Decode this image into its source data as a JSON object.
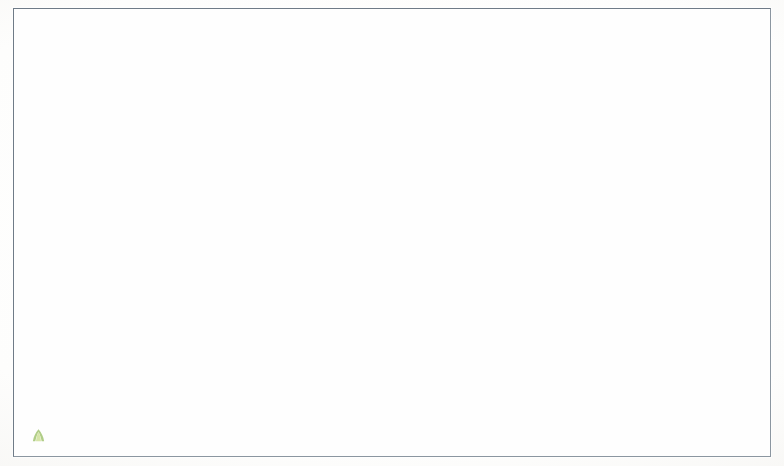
{
  "app": {
    "tool_name": "VOSviewer",
    "visualization_type": "bibliometric co-citation network map"
  },
  "chart_data": {
    "type": "scatter",
    "title": "",
    "xlabel": "",
    "ylabel": "",
    "grid": false,
    "legend": "none",
    "cluster_colors": {
      "cluster_1_social_science": "#e0633f",
      "cluster_2_economics": "#e8a4c8"
    },
    "note": "Node size encodes citation weight; node color encodes cluster; labels are abbreviated journal titles.",
    "nodes": [
      {
        "label": "Appl Energ",
        "x": 412,
        "y": 19,
        "size": 7,
        "cluster": 1
      },
      {
        "label": "Am J Agr Econ",
        "x": 488,
        "y": 14,
        "size": 3,
        "cluster": 1
      },
      {
        "label": "China Agrican Rev",
        "x": 513,
        "y": 46,
        "size": 2,
        "cluster": 1
      },
      {
        "label": "Annu Rev Anthropol",
        "x": 249,
        "y": 62,
        "size": 6,
        "cluster": 1
      },
      {
        "label": "Schumpeter Publ",
        "x": 580,
        "y": 58,
        "size": 3,
        "cluster": 1
      },
      {
        "label": "J Econometrics",
        "x": 711,
        "y": 68,
        "size": 3,
        "cluster": 2
      },
      {
        "label": "Contemp Pacific",
        "x": 299,
        "y": 84,
        "size": 6,
        "cluster": 1
      },
      {
        "label": "J Cold War Stud",
        "x": 371,
        "y": 81,
        "size": 8,
        "cluster": 1
      },
      {
        "label": "Hist Soc Emerg",
        "x": 452,
        "y": 82,
        "size": 3,
        "cluster": 1
      },
      {
        "label": "Renew Energy Econ",
        "x": 546,
        "y": 72,
        "size": 3,
        "cluster": 1
      },
      {
        "label": "Hum Ecol",
        "x": 400,
        "y": 100,
        "size": 9,
        "cluster": 1
      },
      {
        "label": "Oxford Rev Econ Pol",
        "x": 538,
        "y": 98,
        "size": 3,
        "cluster": 1
      },
      {
        "label": "J Rural Stud",
        "x": 412,
        "y": 125,
        "size": 9,
        "cluster": 1
      },
      {
        "label": "Am Anthropol",
        "x": 305,
        "y": 128,
        "size": 7,
        "cluster": 1
      },
      {
        "label": "Soc Res Behav Sc",
        "x": 561,
        "y": 136,
        "size": 3,
        "cluster": 1
      },
      {
        "label": "Ethnohistory",
        "x": 337,
        "y": 150,
        "size": 8,
        "cluster": 1
      },
      {
        "label": "Asian Econ Pap",
        "x": 668,
        "y": 143,
        "size": 3,
        "cluster": 2
      },
      {
        "label": "J Mod Afr Stud",
        "x": 83,
        "y": 168,
        "size": 6,
        "cluster": 1
      },
      {
        "label": "Defence Econ Soc Ger",
        "x": 435,
        "y": 158,
        "size": 5,
        "cluster": 1
      },
      {
        "label": "Geoforum",
        "x": 426,
        "y": 170,
        "size": 9,
        "cluster": 1
      },
      {
        "label": "World Bank Res Obser",
        "x": 585,
        "y": 172,
        "size": 4,
        "cluster": 2
      },
      {
        "label": "B Indones Econ Stud",
        "x": 714,
        "y": 170,
        "size": 3,
        "cluster": 2
      },
      {
        "label": "J Mat Cult",
        "x": 329,
        "y": 179,
        "size": 8,
        "cluster": 1
      },
      {
        "label": "T I Brit Geogr",
        "x": 425,
        "y": 185,
        "size": 8,
        "cluster": 1
      },
      {
        "label": "Soc Psic Soci",
        "x": 475,
        "y": 183,
        "size": 4,
        "cluster": 1
      },
      {
        "label": "J Environ Econ Manag",
        "x": 627,
        "y": 191,
        "size": 4,
        "cluster": 2
      },
      {
        "label": "Polit Geogr",
        "x": 429,
        "y": 199,
        "size": 9,
        "cluster": 1
      },
      {
        "label": "Econ Geogr",
        "x": 481,
        "y": 200,
        "size": 5,
        "cluster": 1
      },
      {
        "label": "Oxford B Econ Stat",
        "x": 668,
        "y": 209,
        "size": 4,
        "cluster": 2
      },
      {
        "label": "Oceania",
        "x": 285,
        "y": 211,
        "size": 6,
        "cluster": 1
      },
      {
        "label": "Am Ethnol",
        "x": 348,
        "y": 207,
        "size": 8,
        "cluster": 1
      },
      {
        "label": "Contemp Econ Policy",
        "x": 627,
        "y": 221,
        "size": 4,
        "cluster": 2
      },
      {
        "label": "J Econometrica",
        "x": 710,
        "y": 221,
        "size": 5,
        "cluster": 2
      },
      {
        "label": "Sensi Cult",
        "x": 356,
        "y": 226,
        "size": 7,
        "cluster": 1
      },
      {
        "label": "Econ Model",
        "x": 689,
        "y": 238,
        "size": 6,
        "cluster": 2
      },
      {
        "label": "Africa",
        "x": 397,
        "y": 239,
        "size": 9,
        "cluster": 1
      },
      {
        "label": "J Am Hist",
        "x": 460,
        "y": 241,
        "size": 8,
        "cluster": 1
      },
      {
        "label": "World Dev",
        "x": 555,
        "y": 239,
        "size": 7,
        "cluster": 1
      },
      {
        "label": "Empir Econ",
        "x": 632,
        "y": 248,
        "size": 4,
        "cluster": 2
      },
      {
        "label": "Appl Econ",
        "x": 699,
        "y": 254,
        "size": 6,
        "cluster": 2
      },
      {
        "label": "Med Anthropol Q",
        "x": 199,
        "y": 251,
        "size": 7,
        "cluster": 1
      },
      {
        "label": "East Afr Stud",
        "x": 430,
        "y": 256,
        "size": 10,
        "cluster": 1
      },
      {
        "label": "Transylv Rev Adm Sc",
        "x": 589,
        "y": 253,
        "size": 5,
        "cluster": 1
      },
      {
        "label": "Popul Dev Rev",
        "x": 330,
        "y": 255,
        "size": 6,
        "cluster": 1
      },
      {
        "label": "Hist Psychiatry",
        "x": 175,
        "y": 271,
        "size": 6,
        "cluster": 1
      },
      {
        "label": "J Dev Econ",
        "x": 679,
        "y": 272,
        "size": 9,
        "cluster": 2
      },
      {
        "label": "Rev Quant Henry",
        "x": 740,
        "y": 268,
        "size": 4,
        "cluster": 2
      },
      {
        "label": "Demogr Res",
        "x": 327,
        "y": 271,
        "size": 6,
        "cluster": 1
      },
      {
        "label": "Anthropol Q",
        "x": 374,
        "y": 276,
        "size": 7,
        "cluster": 1
      },
      {
        "label": "Contemp Crisi",
        "x": 474,
        "y": 279,
        "size": 9,
        "cluster": 1
      },
      {
        "label": "Int Perspect Sex R",
        "x": 209,
        "y": 289,
        "size": 5,
        "cluster": 1
      },
      {
        "label": "J Comp Econ",
        "x": 681,
        "y": 288,
        "size": 8,
        "cluster": 2
      },
      {
        "label": "Res Mil Indust",
        "x": 582,
        "y": 284,
        "size": 4,
        "cluster": 1
      },
      {
        "label": "Nations",
        "x": 459,
        "y": 292,
        "size": 10,
        "cluster": 1
      },
      {
        "label": "Econ Hist Rev",
        "x": 506,
        "y": 291,
        "size": 8,
        "cluster": 1
      },
      {
        "label": "Econ Gas",
        "x": 741,
        "y": 293,
        "size": 4,
        "cluster": 2
      },
      {
        "label": "Demography",
        "x": 324,
        "y": 301,
        "size": 7,
        "cluster": 1
      },
      {
        "label": "Lat Am Perspect",
        "x": 378,
        "y": 300,
        "size": 8,
        "cluster": 1
      },
      {
        "label": "J Econ Geogr",
        "x": 598,
        "y": 302,
        "size": 5,
        "cluster": 2
      },
      {
        "label": "Cliometrica",
        "x": 635,
        "y": 302,
        "size": 5,
        "cluster": 2
      },
      {
        "label": "J Pers Soc Psychol",
        "x": 260,
        "y": 314,
        "size": 7,
        "cluster": 1
      },
      {
        "label": "Curr Sociol",
        "x": 322,
        "y": 310,
        "size": 7,
        "cluster": 1
      },
      {
        "label": "Hist Soc Stud",
        "x": 353,
        "y": 311,
        "size": 7,
        "cluster": 1
      },
      {
        "label": "Mediterr Polit",
        "x": 475,
        "y": 311,
        "size": 8,
        "cluster": 1
      },
      {
        "label": "J Econ Bhutan",
        "x": 592,
        "y": 316,
        "size": 4,
        "cluster": 2
      },
      {
        "label": "Eur J Polit Econ",
        "x": 672,
        "y": 310,
        "size": 5,
        "cluster": 2
      },
      {
        "label": "Intellig Rev",
        "x": 722,
        "y": 311,
        "size": 4,
        "cluster": 2
      },
      {
        "label": "Soc Influence",
        "x": 323,
        "y": 326,
        "size": 5,
        "cluster": 1
      },
      {
        "label": "The Afr Am Sociol Rev",
        "x": 393,
        "y": 325,
        "size": 9,
        "cluster": 1
      },
      {
        "label": "Democratization",
        "x": 506,
        "y": 325,
        "size": 9,
        "cluster": 1
      },
      {
        "label": "Society",
        "x": 631,
        "y": 326,
        "size": 6,
        "cluster": 2
      },
      {
        "label": "Defence Peace Econ",
        "x": 694,
        "y": 327,
        "size": 9,
        "cluster": 2
      },
      {
        "label": "Aging Ment Health",
        "x": 101,
        "y": 330,
        "size": 4,
        "cluster": 1
      },
      {
        "label": "J Paris Stud Popul",
        "x": 256,
        "y": 320,
        "size": 6,
        "cluster": 1
      },
      {
        "label": "Cult Med Psychiat",
        "x": 128,
        "y": 306,
        "size": 7,
        "cluster": 1
      },
      {
        "label": "J Black Stud",
        "x": 363,
        "y": 348,
        "size": 8,
        "cluster": 1
      },
      {
        "label": "Panchayatu Hist Rangs Sci",
        "x": 436,
        "y": 347,
        "size": 8,
        "cluster": 1
      },
      {
        "label": "J Peace Res",
        "x": 515,
        "y": 345,
        "size": 9,
        "cluster": 1
      },
      {
        "label": "Q J Polit Sci",
        "x": 569,
        "y": 340,
        "size": 6,
        "cluster": 1
      },
      {
        "label": "Int Rev Law Econ",
        "x": 693,
        "y": 339,
        "size": 4,
        "cluster": 2
      },
      {
        "label": "J Relig Health",
        "x": 109,
        "y": 355,
        "size": 5,
        "cluster": 1
      },
      {
        "label": "Appl Res Qual Life",
        "x": 182,
        "y": 357,
        "size": 5,
        "cluster": 1
      },
      {
        "label": "Am Soc Int Law",
        "x": 587,
        "y": 362,
        "size": 4,
        "cluster": 1
      },
      {
        "label": "Amer Soc Demogr Eqg",
        "x": 290,
        "y": 355,
        "size": 6,
        "cluster": 1
      },
      {
        "label": "Crime Law Social Ch",
        "x": 398,
        "y": 370,
        "size": 7,
        "cluster": 1
      },
      {
        "label": "J Legal Stud",
        "x": 671,
        "y": 370,
        "size": 4,
        "cluster": 2
      },
      {
        "label": "Pers Individ Differ",
        "x": 243,
        "y": 368,
        "size": 7,
        "cluster": 1
      },
      {
        "label": "Aggressive Behav",
        "x": 214,
        "y": 381,
        "size": 6,
        "cluster": 1
      },
      {
        "label": "J Psychol Theol",
        "x": 305,
        "y": 385,
        "size": 6,
        "cluster": 1
      },
      {
        "label": "Eur J Crim Pol",
        "x": 375,
        "y": 385,
        "size": 6,
        "cluster": 1
      },
      {
        "label": "Gambling Stud",
        "x": 557,
        "y": 385,
        "size": 7,
        "cluster": 1
      },
      {
        "label": "Psychol J",
        "x": 293,
        "y": 397,
        "size": 5,
        "cluster": 1
      },
      {
        "label": "Columbia J Trans Law",
        "x": 583,
        "y": 399,
        "size": 6,
        "cluster": 1
      },
      {
        "label": "Am Bus Law J",
        "x": 613,
        "y": 406,
        "size": 5,
        "cluster": 1
      },
      {
        "label": "Pac K Criminolog Ps",
        "x": 130,
        "y": 404,
        "size": 4,
        "cluster": 1
      },
      {
        "label": "Harvard J Legis",
        "x": 545,
        "y": 415,
        "size": 6,
        "cluster": 1
      },
      {
        "label": "Aggress Violent Beh",
        "x": 226,
        "y": 413,
        "size": 6,
        "cluster": 1
      },
      {
        "label": "Am Ann Deaf",
        "x": 286,
        "y": 419,
        "size": 6,
        "cluster": 1
      },
      {
        "label": "Yale Law J",
        "x": 585,
        "y": 428,
        "size": 8,
        "cluster": 1
      },
      {
        "label": "Univ Law Kanger",
        "x": 597,
        "y": 441,
        "size": 4,
        "cluster": 1
      }
    ]
  },
  "logo": {
    "wordmark": "VOSviewer",
    "mark_icon": "vosviewer-leaf-icon"
  }
}
